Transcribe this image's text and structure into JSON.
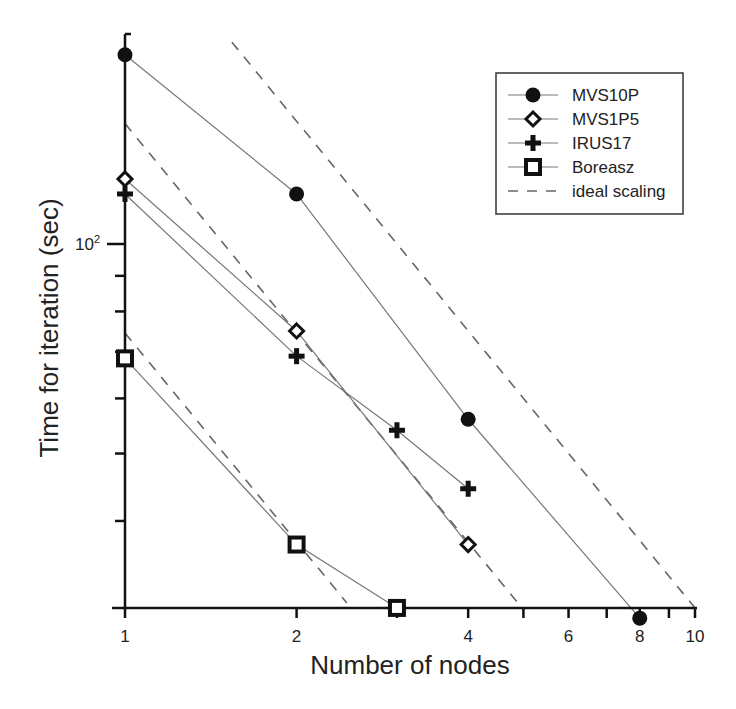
{
  "chart_data": {
    "type": "line",
    "title": "",
    "xlabel": "Number of nodes",
    "ylabel": "Time for iteration (sec)",
    "xscale": "log",
    "yscale": "log",
    "xlim": [
      1,
      10
    ],
    "ylim": [
      30,
      200
    ],
    "x_ticks": [
      1,
      2,
      3,
      4,
      5,
      6,
      7,
      8,
      9,
      10
    ],
    "x_tick_labels": [
      "1",
      "2",
      "",
      "4",
      "",
      "6",
      "",
      "8",
      "",
      "10"
    ],
    "y_ticks": [
      30,
      40,
      50,
      60,
      70,
      80,
      90,
      100,
      200
    ],
    "y_tick_labels": [
      "",
      "",
      "",
      "",
      "",
      "",
      "",
      "10²",
      ""
    ],
    "grid": false,
    "legend_position": "upper right",
    "series": [
      {
        "name": "MVS10P",
        "marker": "filled-circle",
        "x": [
          1,
          2,
          4,
          8
        ],
        "values": [
          187,
          118,
          56,
          29
        ]
      },
      {
        "name": "MVS1P5",
        "marker": "open-diamond",
        "x": [
          1,
          2,
          4
        ],
        "values": [
          124,
          75,
          37
        ]
      },
      {
        "name": "IRUS17",
        "marker": "plus",
        "x": [
          1,
          2,
          3,
          4
        ],
        "values": [
          118,
          69,
          54,
          44.5
        ]
      },
      {
        "name": "Boreasz",
        "marker": "open-square",
        "x": [
          1,
          2,
          3
        ],
        "values": [
          68.5,
          37,
          30
        ]
      }
    ],
    "ideal_scaling": {
      "name": "ideal scaling",
      "style": "dashed",
      "lines": [
        {
          "x": [
            1.54,
            10
          ],
          "values": [
            195,
            30
          ]
        },
        {
          "x": [
            1,
            4.97
          ],
          "values": [
            149,
            30
          ]
        },
        {
          "x": [
            1,
            2.45
          ],
          "values": [
            74.5,
            30.5
          ]
        }
      ]
    },
    "legend": [
      "MVS10P",
      "MVS1P5",
      "IRUS17",
      "Boreasz",
      "ideal scaling"
    ]
  }
}
